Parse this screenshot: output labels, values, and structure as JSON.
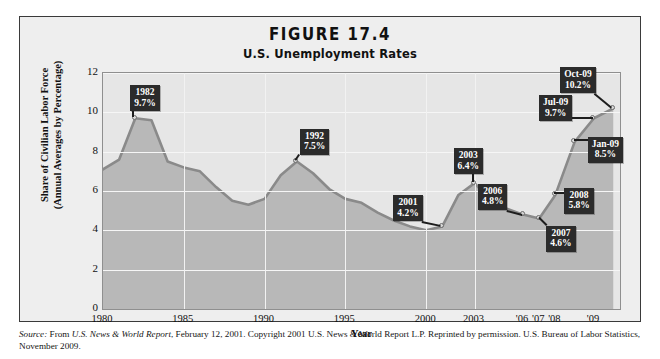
{
  "figure": {
    "number": "FIGURE 17.4",
    "subtitle": "U.S. Unemployment Rates"
  },
  "chart_data": {
    "type": "area",
    "title": "U.S. Unemployment Rates",
    "xlabel": "Year",
    "ylabel": "Share of Civilian Labor Force (Annual Averages by Percentage)",
    "ylabel_line1": "Share of Civilian Labor Force",
    "ylabel_line2": "(Annual Averages by Percentage)",
    "ylim": [
      0,
      12
    ],
    "yticks": [
      0,
      2,
      4,
      6,
      8,
      10,
      12
    ],
    "ytick_labels": [
      "0",
      "2",
      "4",
      "6",
      "8",
      "10",
      "12"
    ],
    "xtick_labels": [
      "1980",
      "1985",
      "1990",
      "1995",
      "2000",
      "2003",
      "'06",
      "'07",
      "'08",
      "'09"
    ],
    "grid": true,
    "legend": "none",
    "x": [
      "1980",
      "1981",
      "1982",
      "1983",
      "1984",
      "1985",
      "1986",
      "1987",
      "1988",
      "1989",
      "1990",
      "1991",
      "1992",
      "1993",
      "1994",
      "1995",
      "1996",
      "1997",
      "1998",
      "1999",
      "2000",
      "2001",
      "2002",
      "2003",
      "2004",
      "2005",
      "2006",
      "2007",
      "2008",
      "Jan-09",
      "Jul-09",
      "Oct-09"
    ],
    "values": [
      7.1,
      7.6,
      9.7,
      9.6,
      7.5,
      7.2,
      7.0,
      6.2,
      5.5,
      5.3,
      5.6,
      6.8,
      7.5,
      6.9,
      6.1,
      5.6,
      5.4,
      4.9,
      4.5,
      4.2,
      4.0,
      4.2,
      5.8,
      6.4,
      5.5,
      5.1,
      4.8,
      4.6,
      5.8,
      8.5,
      9.7,
      10.2
    ],
    "annotations": [
      {
        "label": "1982",
        "value": "9.7%",
        "y": 9.7
      },
      {
        "label": "1992",
        "value": "7.5%",
        "y": 7.5
      },
      {
        "label": "2001",
        "value": "4.2%",
        "y": 4.2
      },
      {
        "label": "2003",
        "value": "6.4%",
        "y": 6.4
      },
      {
        "label": "2006",
        "value": "4.8%",
        "y": 4.8
      },
      {
        "label": "2007",
        "value": "4.6%",
        "y": 4.6
      },
      {
        "label": "2008",
        "value": "5.8%",
        "y": 5.8
      },
      {
        "label": "Jan-09",
        "value": "8.5%",
        "y": 8.5
      },
      {
        "label": "Jul-09",
        "value": "9.7%",
        "y": 9.7
      },
      {
        "label": "Oct-09",
        "value": "10.2%",
        "y": 10.2
      }
    ],
    "colors": {
      "plot_background": "#e6e6e6",
      "area_fill": "#b8b8b8",
      "line": "#8a8a8a",
      "callout_background": "#2b2b2b",
      "callout_text": "#ffffff",
      "figure_background": "#eeeeee",
      "figure_border": "#3a3a3a"
    }
  },
  "source": {
    "label": "Source:",
    "text_1": " From ",
    "publication": "U.S. News & World Report",
    "text_2": ", February 12, 2001. Copyright 2001 U.S. News & World Report L.P. Reprinted by permission. U.S. Bureau of Labor Statistics, November 2009."
  }
}
